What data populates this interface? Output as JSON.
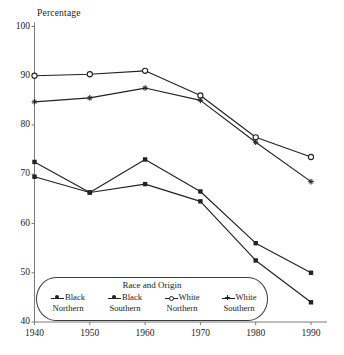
{
  "chart_data": {
    "type": "line",
    "title": "",
    "xlabel": "",
    "ylabel": "Percentage",
    "x": [
      1940,
      1950,
      1960,
      1970,
      1980,
      1990
    ],
    "xtick_labels": [
      "1940",
      "1950",
      "1960",
      "1970",
      "1980",
      "1990"
    ],
    "ytick_labels": [
      "40",
      "50",
      "60",
      "70",
      "80",
      "90",
      "100"
    ],
    "ylim": [
      40,
      100
    ],
    "xlim": [
      1940,
      1990
    ],
    "grid": false,
    "legend_position": "bottom-inside",
    "legend_title": "Race and Origin",
    "series": [
      {
        "name": "Black Northern",
        "label_line1": "Black",
        "label_line2": "Northern",
        "marker": "square",
        "color": "#222222",
        "values": [
          72.5,
          66.3,
          73.0,
          66.5,
          56.0,
          50.0
        ]
      },
      {
        "name": "Black Southern",
        "label_line1": "Black",
        "label_line2": "Southern",
        "marker": "square",
        "color": "#222222",
        "values": [
          69.5,
          66.3,
          68.0,
          64.5,
          52.5,
          44.0
        ]
      },
      {
        "name": "White Northern",
        "label_line1": "White",
        "label_line2": "Northern",
        "marker": "open-circle",
        "color": "#222222",
        "values": [
          90.0,
          90.3,
          91.0,
          86.0,
          77.5,
          73.5
        ]
      },
      {
        "name": "White Southern",
        "label_line1": "White",
        "label_line2": "Southern",
        "marker": "star",
        "color": "#222222",
        "values": [
          84.7,
          85.5,
          87.5,
          85.0,
          76.5,
          68.5
        ]
      }
    ]
  }
}
